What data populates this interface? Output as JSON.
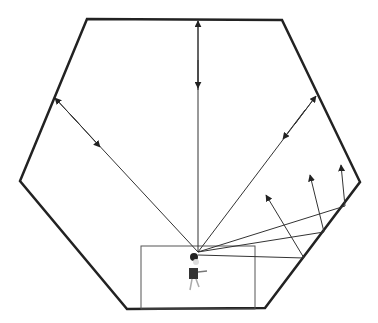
{
  "diagram": {
    "colors": {
      "wall": "#222222",
      "ray": "#333333",
      "box": "#555555",
      "background": "#ffffff"
    },
    "icons": {
      "person": "person-figure"
    }
  }
}
